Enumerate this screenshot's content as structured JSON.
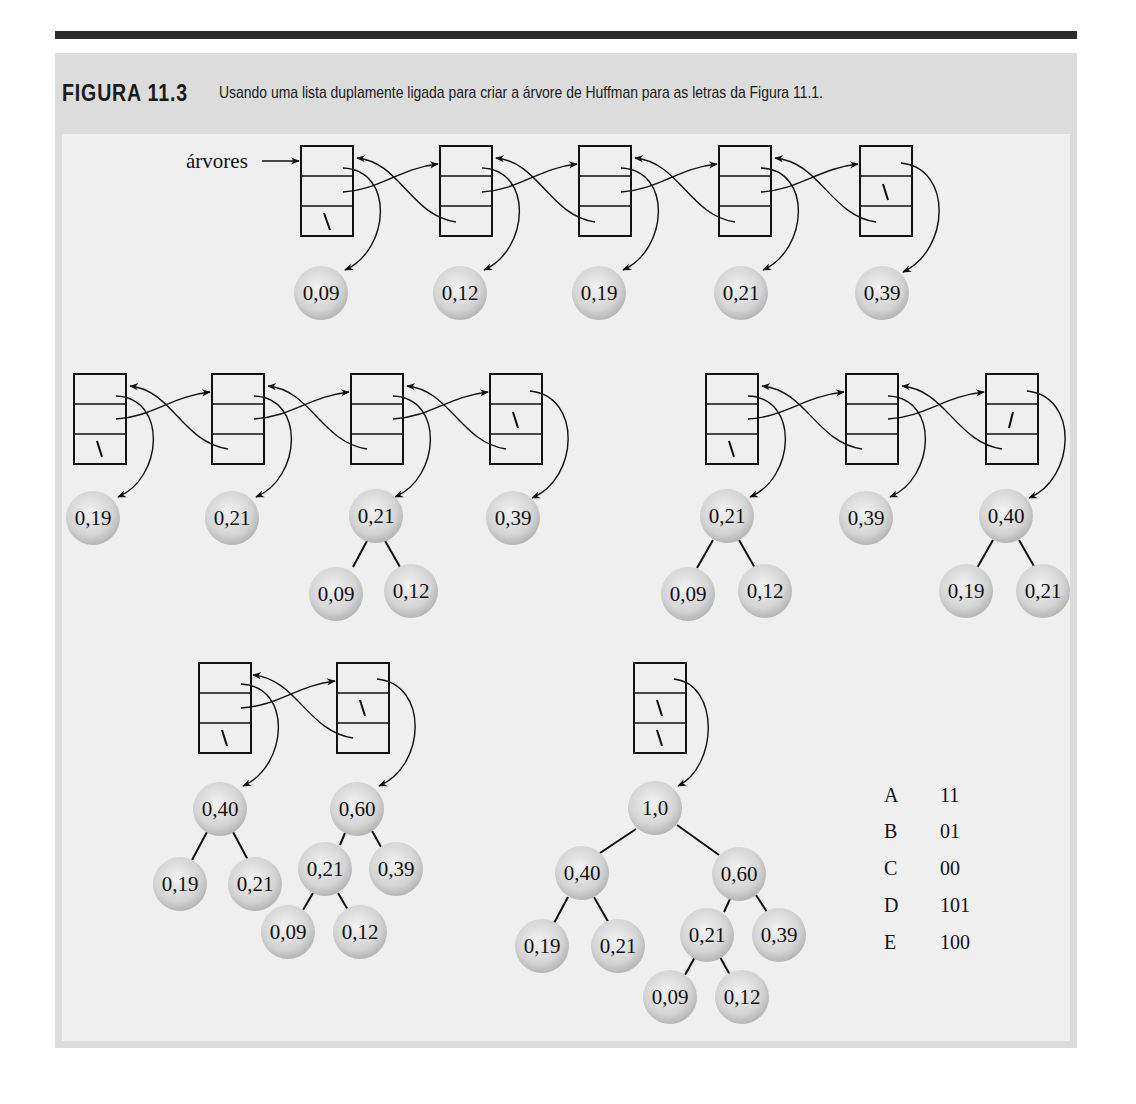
{
  "caption": {
    "number": "FIGURA 11.3",
    "text": "Usando uma lista duplamente ligada para criar a árvore de Huffman para as letras da Figura 11.1."
  },
  "pointer_label": "árvores",
  "colors": {
    "rule": "#2b2b2b",
    "frame": "#dcdcdc",
    "panel": "#efefef",
    "ball_center": "#f0f0f0",
    "ball_edge": "#b8b8b8",
    "stroke": "#111111"
  },
  "stages": [
    {
      "name": "stage-1",
      "nodes": [
        "0,09",
        "0,12",
        "0,19",
        "0,21",
        "0,39"
      ]
    },
    {
      "name": "stage-2",
      "nodes": [
        "0,19",
        "0,21",
        "0,21",
        "0,39"
      ],
      "subtrees": [
        {
          "root": "0,21",
          "children": [
            "0,09",
            "0,12"
          ]
        }
      ]
    },
    {
      "name": "stage-3",
      "nodes": [
        "0,21",
        "0,39",
        "0,40"
      ],
      "subtrees": [
        {
          "root": "0,21",
          "children": [
            "0,09",
            "0,12"
          ]
        },
        {
          "root": "0,40",
          "children": [
            "0,19",
            "0,21"
          ]
        }
      ]
    },
    {
      "name": "stage-4",
      "nodes": [
        "0,40",
        "0,60"
      ],
      "subtrees": [
        {
          "root": "0,40",
          "children": [
            "0,19",
            "0,21"
          ]
        },
        {
          "root": "0,60",
          "children": [
            "0,21",
            "0,39"
          ]
        },
        {
          "root": "0,21",
          "children": [
            "0,09",
            "0,12"
          ]
        }
      ]
    },
    {
      "name": "stage-5",
      "nodes": [
        "1,0"
      ],
      "subtrees": [
        {
          "root": "1,0",
          "children": [
            "0,40",
            "0,60"
          ]
        }
      ]
    }
  ],
  "codes": [
    {
      "letter": "A",
      "code": "11"
    },
    {
      "letter": "B",
      "code": "01"
    },
    {
      "letter": "C",
      "code": "00"
    },
    {
      "letter": "D",
      "code": "101"
    },
    {
      "letter": "E",
      "code": "100"
    }
  ],
  "balls": {
    "s1": [
      "0,09",
      "0,12",
      "0,19",
      "0,21",
      "0,39"
    ],
    "s2": [
      "0,19",
      "0,21",
      "0,21",
      "0,39",
      "0,09",
      "0,12"
    ],
    "s3": [
      "0,21",
      "0,39",
      "0,40",
      "0,09",
      "0,12",
      "0,19",
      "0,21"
    ],
    "s4": [
      "0,40",
      "0,60",
      "0,19",
      "0,21",
      "0,21",
      "0,39",
      "0,09",
      "0,12"
    ],
    "s5": [
      "1,0",
      "0,40",
      "0,60",
      "0,19",
      "0,21",
      "0,21",
      "0,39",
      "0,09",
      "0,12"
    ]
  },
  "null_mark": "\\"
}
